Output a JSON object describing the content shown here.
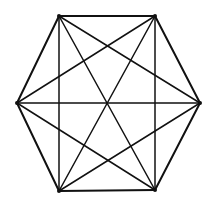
{
  "diagram": {
    "type": "complete-graph-hexagon",
    "stroke_color": "#111111",
    "background": "#ffffff",
    "vertices": [
      {
        "id": "A",
        "x": 59,
        "y": 16
      },
      {
        "id": "B",
        "x": 155,
        "y": 16
      },
      {
        "id": "C",
        "x": 200,
        "y": 103
      },
      {
        "id": "D",
        "x": 155,
        "y": 190
      },
      {
        "id": "E",
        "x": 59,
        "y": 191
      },
      {
        "id": "F",
        "x": 17,
        "y": 103
      }
    ],
    "edge_count": 15
  }
}
